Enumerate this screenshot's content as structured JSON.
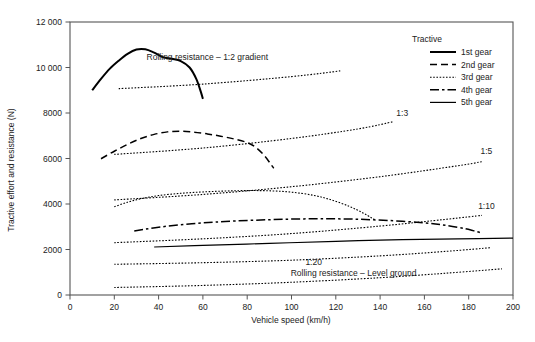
{
  "chart_data": {
    "type": "line",
    "title": "",
    "xlabel": "Vehicle speed (km/h)",
    "ylabel": "Tractive effort and resistance (N)",
    "xlim": [
      0,
      200
    ],
    "ylim": [
      0,
      12000
    ],
    "xticks": [
      0,
      20,
      40,
      60,
      80,
      100,
      120,
      140,
      160,
      180,
      200
    ],
    "xtick_labels": [
      "0",
      "20",
      "40",
      "60",
      "80",
      "100",
      "120",
      "140",
      "160",
      "180",
      "200"
    ],
    "yticks": [
      0,
      2000,
      4000,
      6000,
      8000,
      10000,
      12000
    ],
    "ytick_labels": [
      "0",
      "2000",
      "4000",
      "6000",
      "8000",
      "10 000",
      "12 000"
    ],
    "grid": false,
    "legend_position": "top-right",
    "legend_title": "Tractive",
    "series": [
      {
        "name": "1st gear",
        "style": "solid-thick",
        "points": [
          [
            10,
            9000
          ],
          [
            14,
            9500
          ],
          [
            18,
            9950
          ],
          [
            22,
            10300
          ],
          [
            26,
            10600
          ],
          [
            30,
            10790
          ],
          [
            34,
            10800
          ],
          [
            38,
            10650
          ],
          [
            42,
            10450
          ],
          [
            46,
            10380
          ],
          [
            50,
            10280
          ],
          [
            54,
            10000
          ],
          [
            57,
            9500
          ],
          [
            59,
            8950
          ],
          [
            60,
            8620
          ]
        ]
      },
      {
        "name": "2nd gear",
        "style": "dashed",
        "points": [
          [
            14,
            5990
          ],
          [
            20,
            6320
          ],
          [
            26,
            6620
          ],
          [
            32,
            6880
          ],
          [
            38,
            7060
          ],
          [
            44,
            7170
          ],
          [
            50,
            7200
          ],
          [
            56,
            7160
          ],
          [
            62,
            7080
          ],
          [
            68,
            6980
          ],
          [
            74,
            6860
          ],
          [
            80,
            6700
          ],
          [
            84,
            6480
          ],
          [
            88,
            6100
          ],
          [
            91,
            5700
          ],
          [
            92,
            5570
          ]
        ]
      },
      {
        "name": "3rd gear",
        "style": "dotted",
        "points": [
          [
            20,
            3880
          ],
          [
            26,
            4080
          ],
          [
            32,
            4230
          ],
          [
            40,
            4370
          ],
          [
            50,
            4470
          ],
          [
            60,
            4530
          ],
          [
            70,
            4570
          ],
          [
            80,
            4590
          ],
          [
            90,
            4580
          ],
          [
            100,
            4520
          ],
          [
            110,
            4380
          ],
          [
            118,
            4180
          ],
          [
            126,
            3900
          ],
          [
            132,
            3620
          ],
          [
            136,
            3400
          ],
          [
            138,
            3290
          ]
        ]
      },
      {
        "name": "4th gear",
        "style": "dashdot",
        "points": [
          [
            29,
            2810
          ],
          [
            40,
            2980
          ],
          [
            55,
            3130
          ],
          [
            70,
            3230
          ],
          [
            90,
            3310
          ],
          [
            110,
            3350
          ],
          [
            130,
            3330
          ],
          [
            150,
            3240
          ],
          [
            165,
            3120
          ],
          [
            175,
            2980
          ],
          [
            182,
            2830
          ],
          [
            186,
            2720
          ]
        ]
      },
      {
        "name": "5th gear",
        "style": "solid-thin",
        "points": [
          [
            38,
            2110
          ],
          [
            60,
            2180
          ],
          [
            90,
            2270
          ],
          [
            120,
            2360
          ],
          [
            150,
            2430
          ],
          [
            175,
            2470
          ],
          [
            200,
            2500
          ]
        ]
      }
    ],
    "resistance_curves": [
      {
        "name": "Rolling resistance - 1:2 gradient",
        "label": "Rolling resistance – 1:2 gradient",
        "style": "dotted",
        "points": [
          [
            22,
            9070
          ],
          [
            60,
            9270
          ],
          [
            100,
            9600
          ],
          [
            122,
            9850
          ]
        ]
      },
      {
        "name": "1:3 gradient",
        "label": "1:3",
        "style": "dotted",
        "points": [
          [
            20,
            6180
          ],
          [
            60,
            6460
          ],
          [
            100,
            6880
          ],
          [
            130,
            7300
          ],
          [
            146,
            7620
          ]
        ]
      },
      {
        "name": "1:5 gradient",
        "label": "1:5",
        "style": "dotted",
        "points": [
          [
            20,
            4180
          ],
          [
            60,
            4420
          ],
          [
            100,
            4760
          ],
          [
            140,
            5200
          ],
          [
            175,
            5680
          ],
          [
            186,
            5860
          ]
        ]
      },
      {
        "name": "1:10 gradient",
        "label": "1:10",
        "style": "dotted",
        "points": [
          [
            20,
            2300
          ],
          [
            60,
            2470
          ],
          [
            100,
            2700
          ],
          [
            140,
            3030
          ],
          [
            170,
            3330
          ],
          [
            186,
            3500
          ]
        ]
      },
      {
        "name": "1:20 gradient",
        "label": "1:20",
        "style": "dotted",
        "points": [
          [
            20,
            1350
          ],
          [
            60,
            1420
          ],
          [
            100,
            1530
          ],
          [
            140,
            1720
          ],
          [
            170,
            1920
          ],
          [
            190,
            2080
          ]
        ]
      },
      {
        "name": "Rolling resistance - Level ground",
        "label": "Rolling resistance – Level ground",
        "style": "dotted",
        "points": [
          [
            20,
            330
          ],
          [
            60,
            420
          ],
          [
            100,
            560
          ],
          [
            140,
            760
          ],
          [
            170,
            960
          ],
          [
            195,
            1150
          ]
        ]
      }
    ],
    "annotations": [
      {
        "text": "Rolling resistance – 1:2 gradient",
        "x": 62,
        "y": 10350
      },
      {
        "text": "1:3",
        "x": 150,
        "y": 7850
      },
      {
        "text": "1:5",
        "x": 188,
        "y": 6180
      },
      {
        "text": "1:10",
        "x": 188,
        "y": 3800
      },
      {
        "text": "1:20",
        "x": 110,
        "y": 1320
      },
      {
        "text": "Rolling resistance – Level ground",
        "x": 128,
        "y": 820
      }
    ]
  },
  "legend": {
    "title": "Tractive",
    "items": [
      {
        "label": "1st gear",
        "style": "solid-thick"
      },
      {
        "label": "2nd gear",
        "style": "dashed"
      },
      {
        "label": "3rd gear",
        "style": "dotted"
      },
      {
        "label": "4th gear",
        "style": "dashdot"
      },
      {
        "label": "5th gear",
        "style": "solid-thin"
      }
    ]
  },
  "colors": {
    "line": "#000000",
    "frame": "#555555",
    "text": "#1a1a1a",
    "background": "#ffffff"
  }
}
